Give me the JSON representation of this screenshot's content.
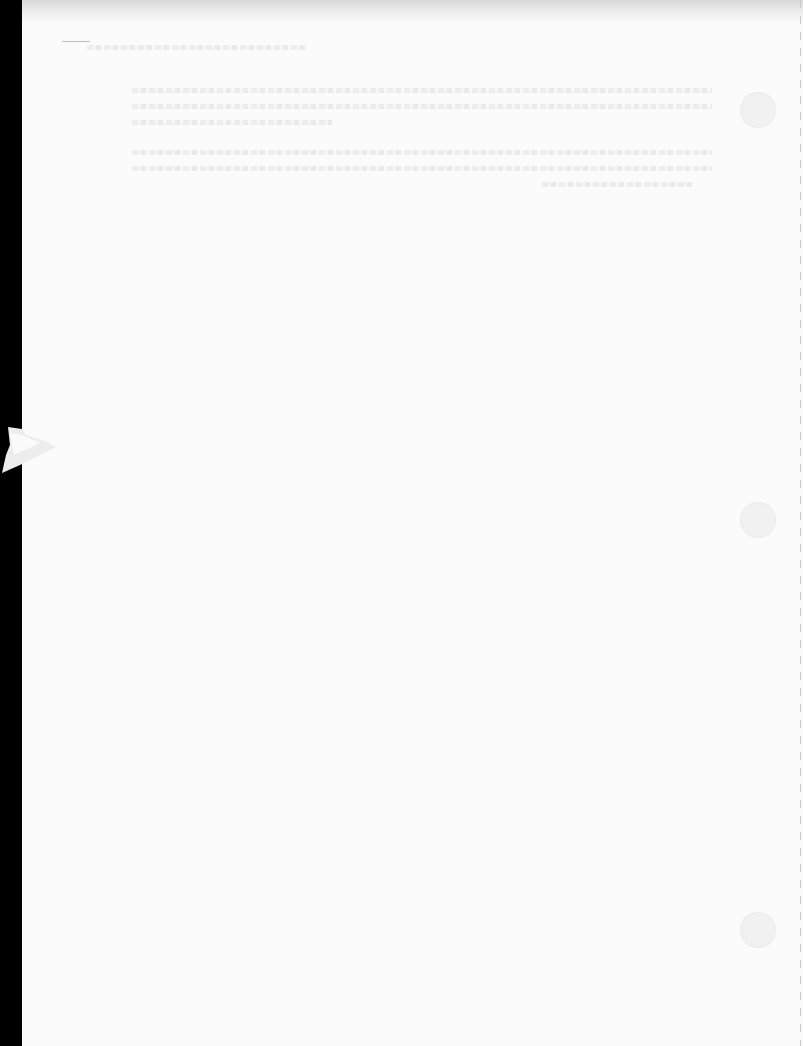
{
  "document": {
    "type": "scanned-page",
    "content_state": "blank page with illegible show-through text",
    "bleed_through_lines": [
      {
        "top": 45,
        "left": 65,
        "width": 220
      },
      {
        "top": 88,
        "left": 110,
        "width": 580
      },
      {
        "top": 104,
        "left": 110,
        "width": 580
      },
      {
        "top": 120,
        "left": 110,
        "width": 200
      },
      {
        "top": 150,
        "left": 110,
        "width": 580
      },
      {
        "top": 166,
        "left": 110,
        "width": 580
      },
      {
        "top": 182,
        "left": 520,
        "width": 150
      }
    ],
    "punch_holes": [
      {
        "top": 92
      },
      {
        "top": 502
      },
      {
        "top": 912
      }
    ],
    "colors": {
      "paper": "#fbfbfb",
      "margin": "#000000",
      "hole": "#f1f1f1",
      "perforation": "#c9c9c9"
    }
  }
}
